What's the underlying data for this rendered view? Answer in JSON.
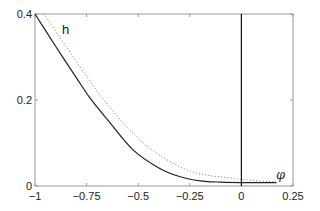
{
  "chart_data": {
    "type": "line",
    "title": "",
    "xlabel": "φ",
    "ylabel": "h",
    "xlim": [
      -1,
      0.25
    ],
    "ylim": [
      0,
      0.4
    ],
    "grid": false,
    "x_ticks": [
      "−1",
      "−0.75",
      "−0.5",
      "−0.25",
      "0",
      "0.25"
    ],
    "y_ticks": [
      "0",
      "0.2",
      "0.4"
    ],
    "annotations": [
      {
        "text": "h",
        "x": -0.86,
        "y": 0.36
      },
      {
        "text": "φ",
        "x": 0.2,
        "y": 0.025
      },
      {
        "type": "vertical-line",
        "x": 0
      }
    ],
    "series": [
      {
        "name": "solid",
        "style": "solid",
        "x": [
          -1.0,
          -0.9,
          -0.8,
          -0.734,
          -0.65,
          -0.525,
          -0.4,
          -0.3,
          -0.2,
          -0.1,
          0.0,
          0.17
        ],
        "y": [
          0.4,
          0.325,
          0.252,
          0.205,
          0.155,
          0.084,
          0.042,
          0.022,
          0.012,
          0.009,
          0.008,
          0.008
        ]
      },
      {
        "name": "dotted",
        "style": "dotted",
        "x": [
          -0.956,
          -0.85,
          -0.75,
          -0.675,
          -0.55,
          -0.433,
          -0.3,
          -0.2,
          -0.1,
          -0.055,
          0.0,
          0.17
        ],
        "y": [
          0.4,
          0.325,
          0.255,
          0.205,
          0.135,
          0.084,
          0.045,
          0.028,
          0.021,
          0.019,
          0.015,
          0.009
        ]
      }
    ]
  },
  "labels": {
    "curve": "h",
    "axis_x": "φ"
  }
}
